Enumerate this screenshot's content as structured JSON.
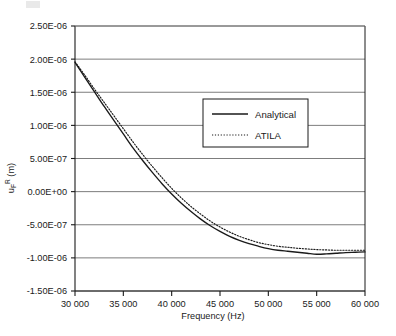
{
  "chart_data": {
    "type": "line",
    "title": "",
    "xlabel": "Frequency (Hz)",
    "ylabel": "u_F^R (m)",
    "ylabel_parts": {
      "base": "u",
      "sup": "R",
      "sub": "F",
      "unit": " (m)"
    },
    "xlim": [
      30000,
      60000
    ],
    "ylim": [
      -1.5e-06,
      2.5e-06
    ],
    "xticks": [
      30000,
      35000,
      40000,
      45000,
      50000,
      55000,
      60000
    ],
    "xtick_labels": [
      "30 000",
      "35 000",
      "40 000",
      "45 000",
      "50 000",
      "55 000",
      "60 000"
    ],
    "yticks": [
      2.5e-06,
      2e-06,
      1.5e-06,
      1e-06,
      5e-07,
      0.0,
      -5e-07,
      -1e-06,
      -1.5e-06
    ],
    "ytick_labels": [
      "2.50E-06",
      "2.00E-06",
      "1.50E-06",
      "1.00E-06",
      "5.00E-07",
      "0.00E+00",
      "-5.00E-07",
      "-1.00E-06",
      "-1.50E-06"
    ],
    "grid": true,
    "grid_axis": "y",
    "legend_position": "upper-right-inside",
    "series": [
      {
        "name": "Analytical",
        "style": "solid",
        "color": "#1a1a1a",
        "x": [
          30000,
          31000,
          32000,
          33000,
          34000,
          35000,
          36000,
          37000,
          38000,
          39000,
          40000,
          41000,
          42000,
          43000,
          44000,
          45000,
          46000,
          47000,
          48000,
          49000,
          50000,
          51000,
          52000,
          53000,
          54000,
          55000,
          56000,
          57000,
          58000,
          59000,
          60000
        ],
        "y": [
          1.95e-06,
          1.73e-06,
          1.51e-06,
          1.29e-06,
          1.08e-06,
          8.7e-07,
          6.6e-07,
          4.7e-07,
          2.9e-07,
          1.2e-07,
          -3.5e-08,
          -1.75e-07,
          -3e-07,
          -4.15e-07,
          -5.15e-07,
          -6e-07,
          -6.75e-07,
          -7.35e-07,
          -7.85e-07,
          -8.25e-07,
          -8.6e-07,
          -8.85e-07,
          -9e-07,
          -9.15e-07,
          -9.3e-07,
          -9.45e-07,
          -9.4e-07,
          -9.3e-07,
          -9.2e-07,
          -9.15e-07,
          -9.1e-07
        ]
      },
      {
        "name": "ATILA",
        "style": "dotted",
        "color": "#1a1a1a",
        "x": [
          30000,
          31000,
          32000,
          33000,
          34000,
          35000,
          36000,
          37000,
          38000,
          39000,
          40000,
          41000,
          42000,
          43000,
          44000,
          45000,
          46000,
          47000,
          48000,
          49000,
          50000,
          51000,
          52000,
          53000,
          54000,
          55000,
          56000,
          57000,
          58000,
          59000,
          60000
        ],
        "y": [
          1.96e-06,
          1.76e-06,
          1.55e-06,
          1.35e-06,
          1.15e-06,
          9.5e-07,
          7.5e-07,
          5.6e-07,
          3.8e-07,
          2.1e-07,
          5e-08,
          -9.5e-08,
          -2.25e-07,
          -3.4e-07,
          -4.45e-07,
          -5.35e-07,
          -6.1e-07,
          -6.75e-07,
          -7.25e-07,
          -7.7e-07,
          -8e-07,
          -8.25e-07,
          -8.4e-07,
          -8.55e-07,
          -8.65e-07,
          -8.75e-07,
          -8.8e-07,
          -8.85e-07,
          -8.85e-07,
          -8.85e-07,
          -8.85e-07
        ]
      }
    ]
  },
  "legend": {
    "entries": [
      {
        "label": "Analytical",
        "style": "solid"
      },
      {
        "label": "ATILA",
        "style": "dotted"
      }
    ]
  },
  "axes": {
    "x_title": "Frequency (Hz)"
  },
  "colors": {
    "line": "#1a1a1a",
    "grid": "#6e6e6e",
    "axis": "#1a1a1a",
    "background": "#ffffff"
  }
}
